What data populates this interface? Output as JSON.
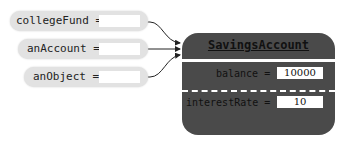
{
  "references": [
    {
      "name": "collegeFund",
      "label": "collegeFund ="
    },
    {
      "name": "anAccount",
      "label": "anAccount ="
    },
    {
      "name": "anObject",
      "label": "anObject ="
    }
  ],
  "object": {
    "class_name": "SavingsAccount",
    "fields": [
      {
        "name": "balance",
        "label": "balance =",
        "value": "10000"
      },
      {
        "name": "interestRate",
        "label": "interestRate =",
        "value": "10"
      }
    ]
  },
  "colors": {
    "object_fill": "#4a4a4a",
    "reference_fill": "#e2e2e2",
    "arrow": "#222222"
  }
}
